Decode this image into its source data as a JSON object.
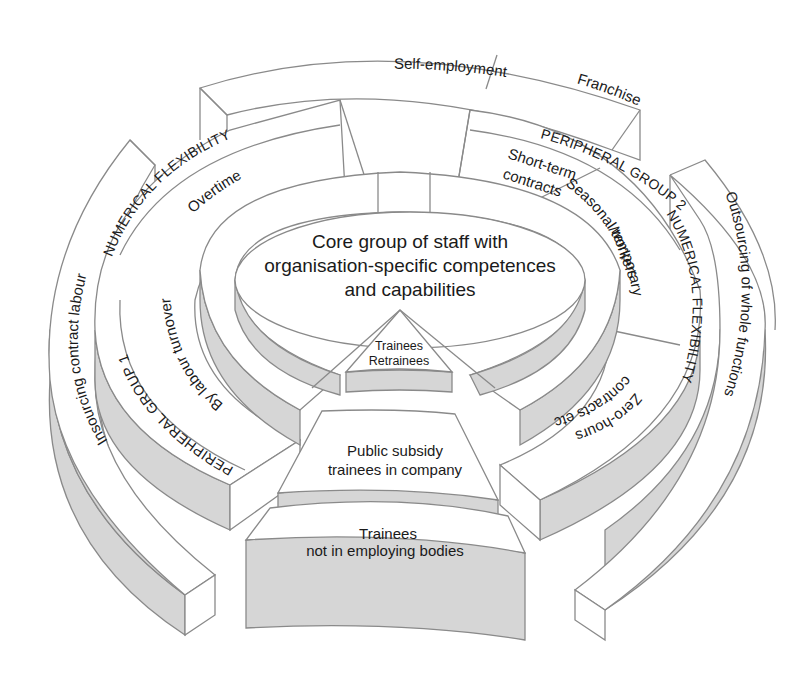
{
  "diagram": {
    "colors": {
      "line": "#8a8a8a",
      "side_fill": "#d6d6d6",
      "top_fill": "#ffffff",
      "text": "#1a1a1a"
    },
    "core": {
      "line1": "Core group of staff with",
      "line2": "organisation-specific competences",
      "line3": "and capabilities"
    },
    "outer_ring_top": {
      "self_employment": "Self-employment",
      "franchise": "Franchise"
    },
    "left_outer": {
      "insourcing": "Insourcing contract labour"
    },
    "peripheral_group_1": {
      "band_label_top": "NUMERICAL FLEXIBILITY",
      "band_label_bottom": "PERIPHERAL GROUP 1",
      "overtime": "Overtime",
      "labour_turnover": "By labour turnover"
    },
    "peripheral_group_2": {
      "band_label_top": "PERIPHERAL GROUP 2",
      "band_label_right": "NUMERICAL FLEXIBILITY",
      "short_term_line1": "Short-term",
      "short_term_line2": "contracts",
      "seasonal_line1": "Seasonal/temporary",
      "seasonal_line2": "workers",
      "zero_hours_line1": "Zero-hours",
      "zero_hours_line2": "contracts etc."
    },
    "right_outer": {
      "outsourcing": "Outsourcing of whole functions"
    },
    "trainees": {
      "inner_line1": "Trainees",
      "inner_line2": "Retrainees",
      "middle_line1": "Public subsidy",
      "middle_line2": "trainees in company",
      "outer_line1": "Trainees",
      "outer_line2": "not in employing bodies"
    }
  }
}
